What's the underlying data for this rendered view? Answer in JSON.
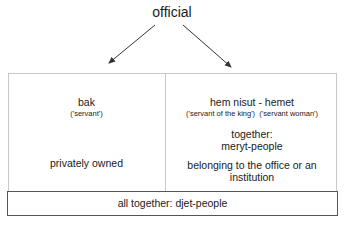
{
  "title": "official",
  "left": {
    "term": "bak",
    "gloss": "('servant')",
    "description": "privately owned"
  },
  "right": {
    "term": "hem nisut  - hemet",
    "gloss_1": "('servant of the king')",
    "gloss_2": "('servant woman')",
    "together_label": "together:",
    "together_value": "meryt-people",
    "description_line1": "belonging to the office or an",
    "description_line2": "institution"
  },
  "footer": "all together: djet-people",
  "colors": {
    "text": "#1a1a1a",
    "border_light": "#c8c8c8",
    "border_dark": "#555555",
    "arrow": "#333333"
  }
}
